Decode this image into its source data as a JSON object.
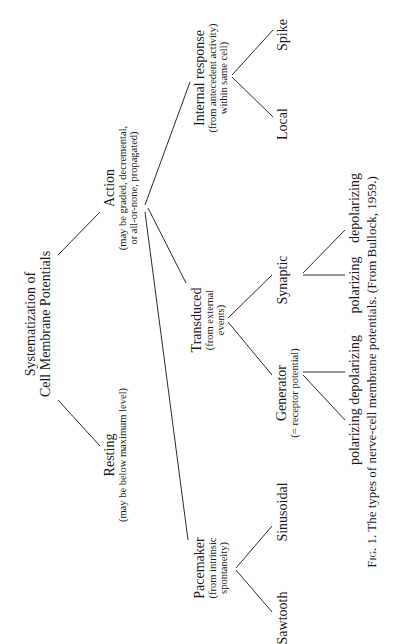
{
  "diagram": {
    "orientation": "rotated 90 degrees counter-clockwise",
    "title": {
      "line1": "Systematization of",
      "line2": "Cell Membrane Potentials"
    },
    "nodes": {
      "resting": {
        "label": "Resting",
        "note": "(may be below maximum level)"
      },
      "action": {
        "label": "Action",
        "note_line1": "(may be graded, decremental,",
        "note_line2": "or all-or-none, propagated)"
      },
      "pacemaker": {
        "label": "Pacemaker",
        "note_line1": "(from intrinsic",
        "note_line2": "spontaneity)"
      },
      "transduced": {
        "label": "Transduced",
        "note_line1": "(from external",
        "note_line2": "events)"
      },
      "internal_response": {
        "label": "Internal response",
        "note_line1": "(from antecedent activity)",
        "note_line2": "within same cell)"
      },
      "sawtooth": {
        "label": "Sawtooth"
      },
      "sinusoidal": {
        "label": "Sinusoidal"
      },
      "generator": {
        "label": "Generator",
        "note": "(= receptor potential)"
      },
      "synaptic": {
        "label": "Synaptic"
      },
      "local": {
        "label": "Local"
      },
      "spike": {
        "label": "Spike"
      },
      "generator_children": {
        "label": "polarizing depolarizing"
      },
      "synaptic_polarizing": {
        "label": "polarizing"
      },
      "synaptic_depolarizing": {
        "label": "depolarizing"
      }
    },
    "edges": [
      [
        "title",
        "resting"
      ],
      [
        "title",
        "action"
      ],
      [
        "action",
        "pacemaker"
      ],
      [
        "action",
        "transduced"
      ],
      [
        "action",
        "internal_response"
      ],
      [
        "pacemaker",
        "sawtooth"
      ],
      [
        "pacemaker",
        "sinusoidal"
      ],
      [
        "transduced",
        "generator"
      ],
      [
        "transduced",
        "synaptic"
      ],
      [
        "generator",
        "polarizing"
      ],
      [
        "generator",
        "depolarizing"
      ],
      [
        "synaptic",
        "polarizing"
      ],
      [
        "synaptic",
        "depolarizing"
      ],
      [
        "internal_response",
        "local"
      ],
      [
        "internal_response",
        "spike"
      ]
    ],
    "caption": {
      "fig": "Fig. 1.",
      "text": "The types of nerve-cell membrane potentials. (From Bullock, 1959.)"
    }
  }
}
